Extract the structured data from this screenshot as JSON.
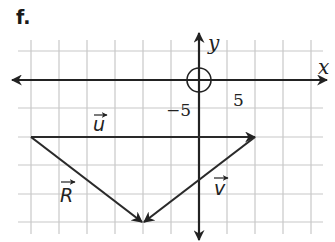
{
  "problem": {
    "label": "f."
  },
  "axes": {
    "x_label": "x",
    "y_label": "y",
    "tick_labels": {
      "negative": "−5",
      "positive": "5"
    }
  },
  "vectors": [
    {
      "name": "u",
      "label": "u",
      "from": [
        -6,
        -2
      ],
      "to": [
        2,
        -2
      ]
    },
    {
      "name": "v",
      "label": "v",
      "from": [
        2,
        -2
      ],
      "to": [
        -2,
        -5
      ]
    },
    {
      "name": "R",
      "label": "R",
      "from": [
        -6,
        -2
      ],
      "to": [
        -2,
        -5
      ]
    }
  ],
  "grid": {
    "spacing_units": 1,
    "x_range": [
      -6,
      4
    ],
    "y_range": [
      -5,
      1
    ]
  },
  "colors": {
    "grid": "#c8c8c8",
    "ink": "#222222"
  }
}
